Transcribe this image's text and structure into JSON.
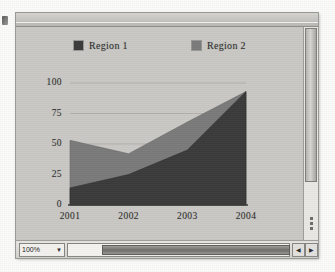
{
  "window": {
    "zoom_value": "100%",
    "zoom_arrow": "▼",
    "scroll_left_arrow": "◀",
    "scroll_right_arrow": "▶"
  },
  "chart_data": {
    "type": "area",
    "title": "",
    "subtitle": "",
    "xlabel": "",
    "ylabel": "",
    "categories": [
      "2001",
      "2002",
      "2003",
      "2004"
    ],
    "series": [
      {
        "name": "Region 1",
        "color": "#3b3b3b",
        "values": [
          14,
          25,
          45,
          93
        ]
      },
      {
        "name": "Region 2",
        "color": "#7b7b7b",
        "values": [
          53,
          42,
          68,
          93
        ]
      }
    ],
    "yticks": [
      "100",
      "75",
      "50",
      "25",
      "0"
    ],
    "ylim": [
      0,
      100
    ],
    "grid": true,
    "legend_position": "top",
    "overlap": "overlapping"
  }
}
